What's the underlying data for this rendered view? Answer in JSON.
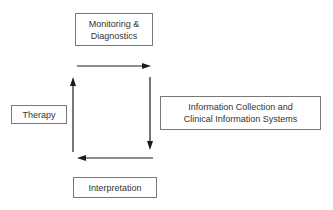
{
  "diagram": {
    "nodes": [
      {
        "id": "monitoring",
        "label": "Monitoring &\nDiagnostics"
      },
      {
        "id": "info",
        "label": "Information Collection and\nClinical Information Systems"
      },
      {
        "id": "interpretation",
        "label": "Interpretation"
      },
      {
        "id": "therapy",
        "label": "Therapy"
      }
    ],
    "edges": [
      {
        "from": "monitoring",
        "to": "info",
        "direction": "right"
      },
      {
        "from": "info",
        "to": "interpretation",
        "direction": "down"
      },
      {
        "from": "interpretation",
        "to": "therapy",
        "direction": "left"
      },
      {
        "from": "therapy",
        "to": "monitoring",
        "direction": "up"
      }
    ],
    "colors": {
      "line": "#1a1a1a",
      "border": "#777777",
      "text": "#333333"
    }
  }
}
